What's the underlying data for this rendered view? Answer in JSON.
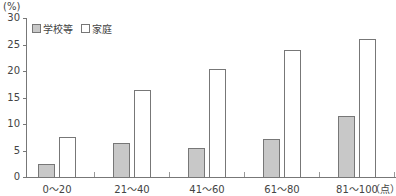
{
  "chart_data": {
    "type": "bar",
    "title": "",
    "ylabel": "(%)",
    "xlabel": "(点)",
    "ylim": [
      0,
      30
    ],
    "yticks": [
      0,
      5,
      10,
      15,
      20,
      25,
      30
    ],
    "categories": [
      "0～20",
      "21～40",
      "41～60",
      "61～80",
      "81～100"
    ],
    "series": [
      {
        "name": "学校等",
        "color": "#c8c8c8",
        "values": [
          2.5,
          6.4,
          5.4,
          7.2,
          11.5
        ]
      },
      {
        "name": "家庭",
        "color": "#ffffff",
        "values": [
          7.6,
          16.4,
          20.3,
          24.0,
          26.0
        ]
      }
    ],
    "grid": false,
    "legend_position": "top-left"
  },
  "labels": {
    "unit_y": "(%)",
    "unit_x": "（点）",
    "legend_school": "学校等",
    "legend_home": "家庭"
  }
}
